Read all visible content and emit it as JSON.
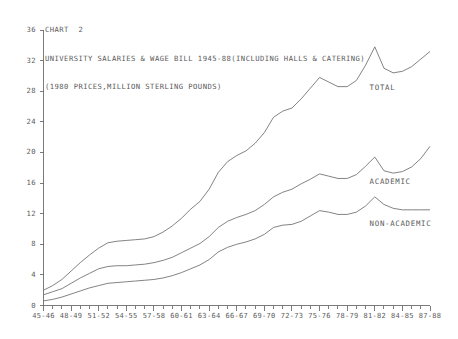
{
  "chart_data": {
    "type": "line",
    "title": "CHART  2",
    "subtitle": "UNIVERSITY SALARIES & WAGE BILL 1945-88(INCLUDING HALLS & CATERING)",
    "subtitle2": "(1980 PRICES,MILLION STERLING POUNDS)",
    "xlabel": "",
    "ylabel": "",
    "ylim": [
      0,
      36
    ],
    "yticks": [
      0,
      4,
      8,
      12,
      16,
      20,
      24,
      28,
      32,
      36
    ],
    "ytick_labels": [
      "0",
      "4",
      "8",
      "12",
      "16",
      "20",
      "24",
      "28",
      "32",
      "36"
    ],
    "grid": false,
    "legend_position": "inline-right",
    "x": [
      "45-46",
      "46-47",
      "47-48",
      "48-49",
      "49-50",
      "50-51",
      "51-52",
      "52-53",
      "53-54",
      "54-55",
      "55-56",
      "56-57",
      "57-58",
      "58-59",
      "59-60",
      "60-61",
      "61-62",
      "62-63",
      "63-64",
      "64-65",
      "65-66",
      "66-67",
      "67-68",
      "68-69",
      "69-70",
      "70-71",
      "71-72",
      "72-73",
      "73-74",
      "74-75",
      "75-76",
      "76-77",
      "77-78",
      "78-79",
      "79-80",
      "80-81",
      "81-82",
      "82-83",
      "83-84",
      "84-85",
      "85-86",
      "86-87",
      "87-88"
    ],
    "xtick_labels": [
      "45-46",
      "48-49",
      "51-52",
      "54-55",
      "57-58",
      "60-61",
      "63-64",
      "66-67",
      "69-70",
      "72-73",
      "75-76",
      "78-79",
      "81-82",
      "84-85",
      "87-88"
    ],
    "xtick_every": 3,
    "series": [
      {
        "name": "TOTAL",
        "label": "TOTAL",
        "values": [
          2.0,
          2.6,
          3.4,
          4.5,
          5.6,
          6.6,
          7.5,
          8.2,
          8.4,
          8.5,
          8.6,
          8.7,
          9.0,
          9.6,
          10.4,
          11.4,
          12.6,
          13.6,
          15.2,
          17.4,
          18.8,
          19.6,
          20.2,
          21.2,
          22.6,
          24.6,
          25.4,
          25.8,
          27.0,
          28.4,
          29.8,
          29.2,
          28.6,
          28.6,
          29.4,
          31.4,
          33.8,
          31.0,
          30.4,
          30.6,
          31.2,
          32.2,
          33.2
        ],
        "label_x": "80-81",
        "label_y": 28.4
      },
      {
        "name": "ACADEMIC",
        "label": "ACADEMIC",
        "values": [
          1.4,
          1.8,
          2.2,
          2.9,
          3.6,
          4.2,
          4.8,
          5.1,
          5.2,
          5.2,
          5.3,
          5.4,
          5.6,
          5.9,
          6.3,
          6.9,
          7.5,
          8.1,
          9.0,
          10.2,
          11.0,
          11.5,
          11.9,
          12.4,
          13.2,
          14.2,
          14.8,
          15.2,
          15.9,
          16.5,
          17.2,
          16.9,
          16.6,
          16.6,
          17.1,
          18.2,
          19.4,
          17.6,
          17.3,
          17.5,
          18.1,
          19.2,
          20.8
        ],
        "label_x": "80-81",
        "label_y": 16.2
      },
      {
        "name": "NON-ACADEMIC",
        "label": "NON-ACADEMIC",
        "values": [
          0.6,
          0.8,
          1.1,
          1.5,
          1.9,
          2.3,
          2.6,
          2.9,
          3.0,
          3.1,
          3.2,
          3.3,
          3.4,
          3.6,
          3.9,
          4.3,
          4.8,
          5.3,
          6.0,
          7.0,
          7.6,
          8.0,
          8.3,
          8.7,
          9.3,
          10.2,
          10.5,
          10.6,
          11.0,
          11.7,
          12.4,
          12.2,
          11.9,
          11.9,
          12.2,
          13.0,
          14.2,
          13.2,
          12.7,
          12.5,
          12.5,
          12.5,
          12.5
        ],
        "label_x": "80-81",
        "label_y": 10.6
      }
    ]
  },
  "axis": {
    "y_axis_name": "y-axis",
    "x_axis_name": "x-axis"
  }
}
